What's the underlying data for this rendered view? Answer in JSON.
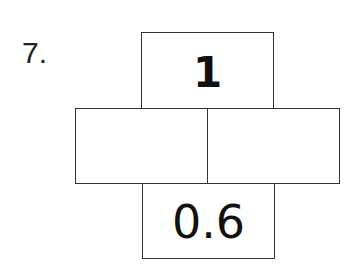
{
  "question": {
    "number_label": "7."
  },
  "number_bond": {
    "top": {
      "value": "1"
    },
    "parts": [
      {
        "value": ""
      },
      {
        "value": ""
      }
    ],
    "bottom": {
      "value": "0.6"
    }
  },
  "colors": {
    "border": "#333333",
    "text": "#111111",
    "background": "#ffffff"
  }
}
